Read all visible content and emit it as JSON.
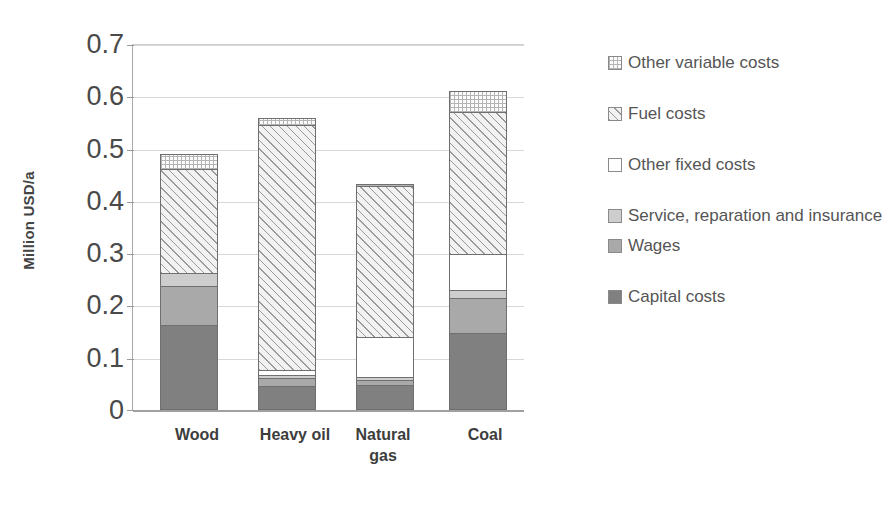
{
  "chart_data": {
    "type": "bar",
    "subtype": "stacked-bar",
    "title": "",
    "xlabel": "",
    "ylabel": "Million USD/a",
    "ylim": [
      0,
      0.7
    ],
    "yticks": [
      "0",
      "0.1",
      "0.2",
      "0.3",
      "0.4",
      "0.5",
      "0.6",
      "0.7"
    ],
    "ytick_values": [
      0,
      0.1,
      0.2,
      0.3,
      0.4,
      0.5,
      0.6,
      0.7
    ],
    "grid": true,
    "legend_position": "right",
    "categories": [
      "Wood",
      "Heavy oil",
      "Natural\ngas",
      "Coal"
    ],
    "stack_order_bottom_to_top": [
      "Capital costs",
      "Wages",
      "Service, reparation and insurance",
      "Other fixed costs",
      "Fuel costs",
      "Other variable costs"
    ],
    "series": [
      {
        "name": "Capital costs",
        "values": [
          0.163,
          0.047,
          0.048,
          0.148
        ]
      },
      {
        "name": "Wages",
        "values": [
          0.075,
          0.014,
          0.01,
          0.066
        ]
      },
      {
        "name": "Service, reparation and insurance",
        "values": [
          0.024,
          0.007,
          0.006,
          0.017
        ]
      },
      {
        "name": "Other fixed costs",
        "values": [
          0.0,
          0.008,
          0.076,
          0.069
        ]
      },
      {
        "name": "Fuel costs",
        "values": [
          0.2,
          0.47,
          0.29,
          0.272
        ]
      },
      {
        "name": "Other variable costs",
        "values": [
          0.029,
          0.015,
          0.003,
          0.039
        ]
      }
    ],
    "totals": [
      0.491,
      0.561,
      0.433,
      0.611
    ]
  },
  "legend": {
    "items": [
      {
        "label": "Other variable costs",
        "swatch": "dotted-light",
        "color": "#fbfbfb"
      },
      {
        "label": "Fuel costs",
        "swatch": "diagonal-hatch",
        "color": "#f2f2f2"
      },
      {
        "label": "Other fixed costs",
        "swatch": "white",
        "color": "#ffffff"
      },
      {
        "label": "Service, reparation and insurance",
        "swatch": "light-gray",
        "color": "#cdcdcd"
      },
      {
        "label": "Wages",
        "swatch": "medium-gray",
        "color": "#a9a9a9"
      },
      {
        "label": "Capital costs",
        "swatch": "dark-gray",
        "color": "#808080"
      }
    ]
  },
  "axis": {
    "y_title": "Million USD/a",
    "tick_0": "0",
    "tick_1": "0.1",
    "tick_2": "0.2",
    "tick_3": "0.3",
    "tick_4": "0.4",
    "tick_5": "0.5",
    "tick_6": "0.6",
    "tick_7": "0.7"
  },
  "xaxis": {
    "cat_0": "Wood",
    "cat_1": "Heavy oil",
    "cat_2": "Natural\ngas",
    "cat_3": "Coal"
  }
}
